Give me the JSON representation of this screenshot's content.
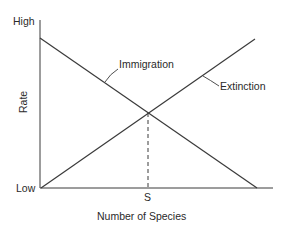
{
  "diagram": {
    "y_axis": {
      "label": "Rate",
      "high_label": "High",
      "low_label": "Low"
    },
    "x_axis": {
      "label": "Number of Species",
      "marker_label": "S"
    },
    "curves": [
      {
        "name": "Immigration",
        "direction": "decreasing",
        "from": [
          40,
          38
        ],
        "to": [
          257,
          188
        ]
      },
      {
        "name": "Extinction",
        "direction": "increasing",
        "from": [
          41,
          188
        ],
        "to": [
          255,
          39
        ]
      }
    ],
    "equilibrium": {
      "x": 148,
      "y": 113,
      "dashed_drop": true
    },
    "colors": {
      "line": "#3a3a3a",
      "text": "#2a2a2a",
      "background": "#ffffff"
    }
  },
  "labels": {
    "high": "High",
    "low": "Low",
    "rate": "Rate",
    "immigration": "Immigration",
    "extinction": "Extinction",
    "s": "S",
    "xlabel": "Number of Species"
  }
}
